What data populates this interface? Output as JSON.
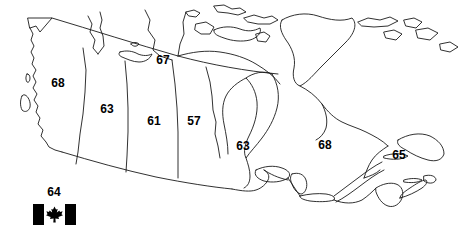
{
  "figure": {
    "type": "map",
    "style": "black and white outline map with provincial and territorial boundaries",
    "background_color": "#ffffff",
    "outline_color": "#000000",
    "label_color": "#000000"
  },
  "region_labels": [
    {
      "name": "british-columbia",
      "value": "68",
      "x": 58,
      "y": 83
    },
    {
      "name": "northwest-territories",
      "value": "67",
      "x": 163,
      "y": 60
    },
    {
      "name": "alberta",
      "value": "63",
      "x": 107,
      "y": 109
    },
    {
      "name": "saskatchewan",
      "value": "61",
      "x": 154,
      "y": 121
    },
    {
      "name": "manitoba",
      "value": "57",
      "x": 194,
      "y": 121
    },
    {
      "name": "ontario",
      "value": "63",
      "x": 243,
      "y": 146
    },
    {
      "name": "quebec",
      "value": "68",
      "x": 325,
      "y": 145
    },
    {
      "name": "atlantic",
      "value": "65",
      "x": 399,
      "y": 155
    }
  ],
  "legend": {
    "value_label": "64",
    "value_label_x": 54,
    "value_label_y": 192,
    "flag_name": "canada-flag",
    "flag_colors": {
      "bars": "#000000",
      "field": "#ffffff",
      "leaf": "#000000"
    }
  }
}
